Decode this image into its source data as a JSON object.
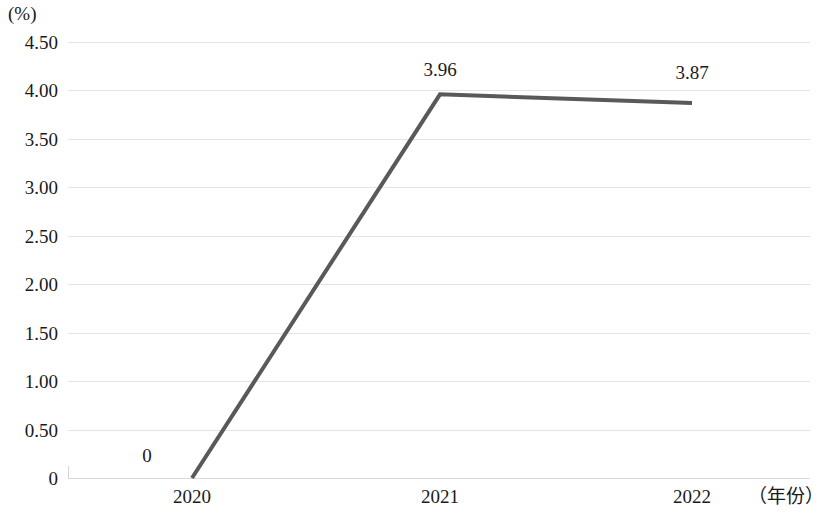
{
  "chart_data": {
    "type": "line",
    "title": "",
    "subtitle": "",
    "xlabel": "（年份）",
    "ylabel": "(%)",
    "categories": [
      "2020",
      "2021",
      "2022"
    ],
    "series": [
      {
        "name": "",
        "values": [
          0,
          3.96,
          3.87
        ],
        "point_labels": [
          "0",
          "3.96",
          "3.87"
        ],
        "color": "#595959",
        "line_width": 4,
        "markers": false
      }
    ],
    "ylim": [
      0,
      4.5
    ],
    "ytick_step": 0.5,
    "ytick_labels": [
      "4.50",
      "4.00",
      "3.50",
      "3.00",
      "2.50",
      "2.00",
      "1.50",
      "1.00",
      "0.50",
      "0"
    ],
    "ytick_values": [
      4.5,
      4.0,
      3.5,
      3.0,
      2.5,
      2.0,
      1.5,
      1.0,
      0.5,
      0
    ],
    "xtick_labels": [
      "2020",
      "2021",
      "2022"
    ],
    "grid": {
      "horizontal": true,
      "vertical": false,
      "color": "#e4e4e4"
    },
    "legend": {
      "visible": false,
      "position": "none"
    },
    "axis_line_color": "#d9d9d9",
    "background": "#ffffff"
  }
}
